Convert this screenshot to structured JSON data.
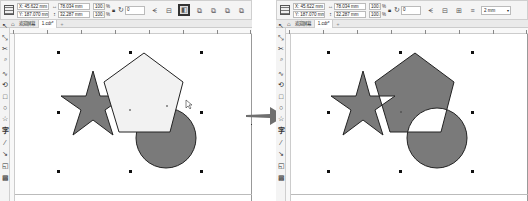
{
  "panels": [
    {
      "id": "before",
      "propbar": {
        "x": "X: 45.622 mm",
        "y": "Y: 187.070 mm",
        "width": "78.034 mm",
        "height": "32.287 mm",
        "scale_w": "100.0",
        "scale_h": "100.0",
        "pct": "%",
        "angle": "0",
        "buttons": [
          "mirror-h",
          "mirror-v",
          "combine",
          "weld",
          "trim",
          "intersect",
          "simplify"
        ],
        "active_button": "combine"
      },
      "tabs": {
        "home": "⌂",
        "welcome": "欢迎屏幕",
        "doc": "1.cdr*",
        "add": "+"
      },
      "description": "Star, pentagon and circle shapes selected; pentagon light-filled on top"
    },
    {
      "id": "after",
      "propbar": {
        "x": "X: 45.622 mm",
        "y": "Y: 187.070 mm",
        "width": "78.034 mm",
        "height": "32.287 mm",
        "scale_w": "100.0",
        "scale_h": "100.0",
        "pct": "%",
        "angle": "0",
        "outline_width": "2 mm"
      },
      "tabs": {
        "home": "⌂",
        "welcome": "欢迎屏幕",
        "doc": "1.cdr*",
        "add": "+"
      },
      "description": "Shapes combined into single object; overlapping areas become holes"
    }
  ],
  "toolbox": {
    "tools": [
      "pick-tool",
      "shape-tool",
      "crop-tool",
      "zoom-tool",
      "freehand-tool",
      "smart-fill-tool",
      "rectangle-tool",
      "ellipse-tool",
      "polygon-tool",
      "text-tool",
      "parallel-dimension-tool",
      "connector-tool",
      "drop-shadow-tool",
      "transparency-tool"
    ],
    "glyphs": [
      "↖",
      "⤡",
      "✂",
      "🔍",
      "∿",
      "⟲",
      "□",
      "○",
      "☆",
      "字",
      "⁄",
      "↘",
      "◱",
      "▩"
    ]
  },
  "colors": {
    "shape_fill": "#7a7a7a",
    "pentagon_light": "#f2f2f2",
    "outline": "#222222",
    "arrow": "#6f6f6f"
  }
}
